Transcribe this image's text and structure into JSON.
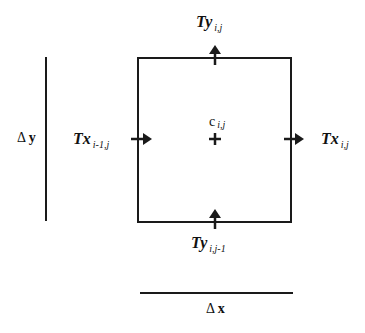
{
  "diagram": {
    "type": "finite-volume control cell",
    "cell": {
      "center_label": "c",
      "center_subscript": "i,j"
    },
    "fluxes": {
      "top": {
        "symbol": "Ty",
        "subscript": "i,j"
      },
      "bottom": {
        "symbol": "Ty",
        "subscript": "i,j-1"
      },
      "left": {
        "symbol": "Tx",
        "subscript": "i-1,j"
      },
      "right": {
        "symbol": "Tx",
        "subscript": "i,j"
      }
    },
    "dimensions": {
      "height": {
        "delta": "Δ",
        "var": "y"
      },
      "width": {
        "delta": "Δ",
        "var": "x"
      }
    },
    "colors": {
      "line": "#1a1a1a",
      "background": "#ffffff"
    }
  }
}
